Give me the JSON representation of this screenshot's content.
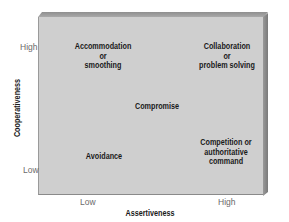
{
  "diagram": {
    "type": "2x2 conflict management grid",
    "x_axis": {
      "title": "Assertiveness",
      "ticks": [
        "Low",
        "High"
      ]
    },
    "y_axis": {
      "title": "Cooperativeness",
      "ticks": [
        "High",
        "Low"
      ]
    },
    "styles": {
      "top_left": [
        "Accommodation",
        "or",
        "smoothing"
      ],
      "top_right": [
        "Collaboration",
        "or",
        "problem solving"
      ],
      "center": [
        "Compromise"
      ],
      "bottom_left": [
        "Avoidance"
      ],
      "bottom_right": [
        "Competition or",
        "authoritative",
        "command"
      ]
    },
    "colors": {
      "face": "#cfcfcf",
      "bevel_top": "#9a9a9a",
      "bevel_right": "#828282",
      "text": "#1a1a1a",
      "tick_text": "#6a6a6a"
    }
  }
}
